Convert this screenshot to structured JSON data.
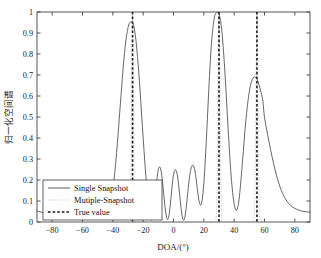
{
  "chart_data": {
    "type": "line",
    "title": "",
    "xlabel": "DOA/(°)",
    "ylabel": "归一化空间谱",
    "xlim": [
      -90,
      90
    ],
    "ylim": [
      0,
      1
    ],
    "xticks": [
      -80,
      -60,
      -40,
      -20,
      0,
      20,
      40,
      60,
      80
    ],
    "xticklabels": [
      "−80",
      "−60",
      "−40",
      "−20",
      "0",
      "20",
      "40",
      "60",
      "80"
    ],
    "yticks": [
      0,
      0.1,
      0.2,
      0.3,
      0.4,
      0.5,
      0.6,
      0.7,
      0.8,
      0.9,
      1
    ],
    "yticklabels": [
      "0",
      "0.1",
      "0.2",
      "0.3",
      "0.4",
      "0.5",
      "0.6",
      "0.7",
      "0.8",
      "0.9",
      "1"
    ],
    "grid": false,
    "legend_position": "lower-left",
    "true_values": [
      -27,
      30,
      55
    ],
    "series": [
      {
        "name": "Single Snapshot",
        "style": "solid",
        "color": "#4a4a4a",
        "peaks": [
          {
            "x": -27,
            "y": 0.95
          },
          {
            "x": 30,
            "y": 0.99
          },
          {
            "x": 55,
            "y": 0.69
          }
        ],
        "x": [
          -90,
          -88,
          -86,
          -84,
          -82,
          -80,
          -78,
          -76,
          -74,
          -72,
          -70,
          -68,
          -66,
          -64,
          -62,
          -60,
          -58,
          -56,
          -54,
          -52,
          -50,
          -48,
          -46,
          -44,
          -42,
          -41,
          -40,
          -39,
          -38,
          -37,
          -36,
          -35,
          -34,
          -33,
          -32,
          -31,
          -30,
          -29,
          -28,
          -27,
          -26,
          -25,
          -24,
          -23,
          -22,
          -21,
          -20,
          -19,
          -18,
          -17,
          -16,
          -15,
          -14,
          -13,
          -12,
          -11,
          -10,
          -9,
          -8,
          -7,
          -6,
          -5,
          -4,
          -3,
          -2,
          -1,
          0,
          1,
          2,
          3,
          4,
          5,
          6,
          7,
          8,
          9,
          10,
          11,
          12,
          13,
          14,
          15,
          16,
          17,
          18,
          19,
          20,
          21,
          22,
          23,
          24,
          25,
          26,
          27,
          28,
          29,
          30,
          31,
          32,
          33,
          34,
          35,
          36,
          37,
          38,
          39,
          40,
          41,
          42,
          43,
          44,
          45,
          46,
          47,
          48,
          49,
          50,
          51,
          52,
          53,
          54,
          55,
          56,
          57,
          58,
          59,
          60,
          62,
          64,
          66,
          68,
          70,
          72,
          74,
          76,
          78,
          80,
          82,
          84,
          86,
          88,
          90
        ],
        "y": [
          0.052,
          0.049,
          0.044,
          0.038,
          0.031,
          0.024,
          0.018,
          0.013,
          0.012,
          0.015,
          0.022,
          0.032,
          0.042,
          0.05,
          0.052,
          0.049,
          0.042,
          0.032,
          0.022,
          0.015,
          0.014,
          0.019,
          0.03,
          0.048,
          0.085,
          0.115,
          0.155,
          0.215,
          0.29,
          0.375,
          0.47,
          0.565,
          0.66,
          0.75,
          0.825,
          0.885,
          0.925,
          0.948,
          0.952,
          0.95,
          0.928,
          0.88,
          0.81,
          0.72,
          0.62,
          0.51,
          0.4,
          0.295,
          0.2,
          0.12,
          0.058,
          0.018,
          0.01,
          0.05,
          0.12,
          0.2,
          0.25,
          0.262,
          0.235,
          0.175,
          0.1,
          0.04,
          0.012,
          0.03,
          0.09,
          0.165,
          0.225,
          0.248,
          0.24,
          0.2,
          0.135,
          0.065,
          0.018,
          0.01,
          0.045,
          0.11,
          0.18,
          0.235,
          0.265,
          0.27,
          0.248,
          0.2,
          0.14,
          0.095,
          0.08,
          0.11,
          0.185,
          0.3,
          0.44,
          0.59,
          0.73,
          0.845,
          0.925,
          0.975,
          0.995,
          0.998,
          0.99,
          0.96,
          0.9,
          0.81,
          0.7,
          0.575,
          0.445,
          0.325,
          0.22,
          0.14,
          0.085,
          0.058,
          0.06,
          0.095,
          0.16,
          0.245,
          0.335,
          0.425,
          0.505,
          0.57,
          0.622,
          0.658,
          0.68,
          0.69,
          0.688,
          0.68,
          0.662,
          0.638,
          0.608,
          0.572,
          0.498,
          0.42,
          0.345,
          0.278,
          0.22,
          0.172,
          0.135,
          0.108,
          0.088,
          0.074,
          0.065,
          0.058,
          0.053,
          0.05,
          0.048,
          0.047
        ]
      },
      {
        "name": "Mutiple-Snapshot",
        "style": "dotted",
        "color": "#b9b9b9",
        "peaks": [
          {
            "x": -27,
            "y": 1.0
          },
          {
            "x": 30,
            "y": 1.0
          },
          {
            "x": 55,
            "y": 1.0
          }
        ]
      },
      {
        "name": "True value",
        "style": "dashed",
        "color": "#1c1c1c"
      }
    ]
  },
  "legend": {
    "items": [
      {
        "label": "Single Snapshot"
      },
      {
        "label": "Mutiple-Snapshot"
      },
      {
        "label": "True value"
      }
    ]
  }
}
